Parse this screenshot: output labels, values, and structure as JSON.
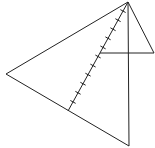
{
  "diagram": {
    "type": "geometry",
    "points": {
      "apex": [
        128,
        2
      ],
      "left": [
        6,
        74
      ],
      "bottom": [
        129,
        146
      ],
      "right": [
        154,
        53
      ],
      "mid_horizontal_left": [
        100,
        53
      ],
      "foot": [
        68,
        111
      ]
    },
    "segments": [
      {
        "name": "apex-left",
        "from": "apex",
        "to": "left"
      },
      {
        "name": "left-bottom",
        "from": "left",
        "to": "bottom"
      },
      {
        "name": "apex-bottom",
        "from": "apex",
        "to": "bottom"
      },
      {
        "name": "apex-right",
        "from": "apex",
        "to": "right"
      },
      {
        "name": "horizontal",
        "from": "mid_horizontal_left",
        "to": "right"
      },
      {
        "name": "ticked-segment",
        "from": "apex",
        "to": "foot",
        "ticks": 11
      }
    ],
    "stroke_color": "#222222"
  }
}
